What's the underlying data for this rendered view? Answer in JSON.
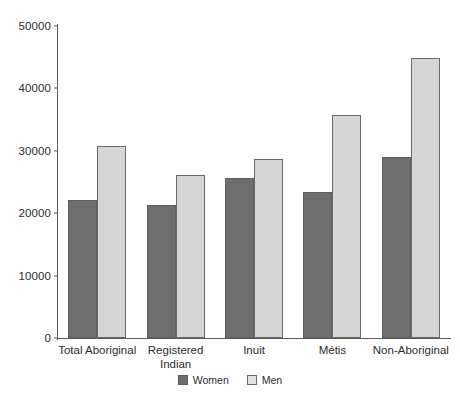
{
  "chart_data": {
    "type": "bar",
    "title": "",
    "subtitle": "",
    "xlabel": "",
    "ylabel": "",
    "categories": [
      "Total Aboriginal",
      "Registered Indian",
      "Inuit",
      "Métis",
      "Non-Aboriginal"
    ],
    "category_lines": [
      [
        "Total Aboriginal"
      ],
      [
        "Registered",
        "Indian"
      ],
      [
        "Inuit"
      ],
      [
        "Métis"
      ],
      [
        "Non-Aboriginal"
      ]
    ],
    "series": [
      {
        "name": "Women",
        "color": "#6e6e6e",
        "values": [
          22100,
          21300,
          25600,
          23400,
          29000
        ]
      },
      {
        "name": "Men",
        "color": "#d6d6d6",
        "values": [
          30800,
          26100,
          28700,
          35700,
          44800
        ]
      }
    ],
    "ylim": [
      0,
      50000
    ],
    "yticks": [
      0,
      10000,
      20000,
      30000,
      40000,
      50000
    ],
    "ytick_labels": [
      "0",
      "10000",
      "20000",
      "30000",
      "40000",
      "50000"
    ],
    "grid": false,
    "legend_position": "bottom-center",
    "legend_entries": [
      "Women",
      "Men"
    ]
  }
}
